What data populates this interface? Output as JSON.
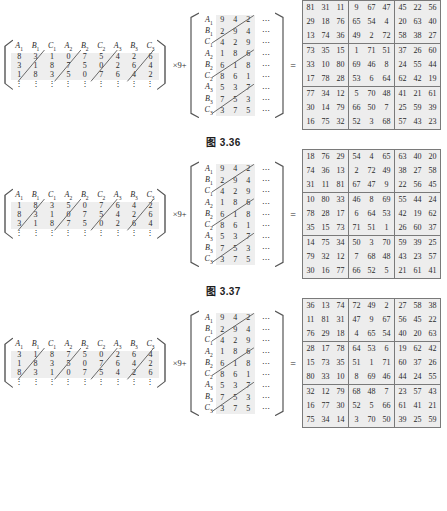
{
  "document": {
    "title": "Latin square matrix construction figures",
    "operator_multiply": "×9+",
    "operator_equals": "="
  },
  "figures": [
    {
      "id": "fig-3-36",
      "caption": "图 3.36",
      "left_matrix": {
        "headers": [
          "A1",
          "B1",
          "C1",
          "A2",
          "B2",
          "C2",
          "A3",
          "B3",
          "C3"
        ],
        "header_display": [
          {
            "base": "A",
            "sub": "1"
          },
          {
            "base": "B",
            "sub": "1"
          },
          {
            "base": "C",
            "sub": "1"
          },
          {
            "base": "A",
            "sub": "2"
          },
          {
            "base": "B",
            "sub": "2"
          },
          {
            "base": "C",
            "sub": "2"
          },
          {
            "base": "A",
            "sub": "3"
          },
          {
            "base": "B",
            "sub": "3"
          },
          {
            "base": "C",
            "sub": "3"
          }
        ],
        "rows": [
          [
            8,
            3,
            1,
            0,
            7,
            5,
            4,
            2,
            6
          ],
          [
            3,
            1,
            8,
            7,
            5,
            0,
            2,
            6,
            4
          ],
          [
            1,
            8,
            3,
            5,
            0,
            7,
            6,
            4,
            2
          ]
        ],
        "continuation": "⋮"
      },
      "mid_matrix": {
        "row_labels": [
          {
            "base": "A",
            "sub": "1"
          },
          {
            "base": "B",
            "sub": "1"
          },
          {
            "base": "C",
            "sub": "1"
          },
          {
            "base": "A",
            "sub": "2"
          },
          {
            "base": "B",
            "sub": "2"
          },
          {
            "base": "C",
            "sub": "2"
          },
          {
            "base": "A",
            "sub": "3"
          },
          {
            "base": "B",
            "sub": "3"
          },
          {
            "base": "C",
            "sub": "3"
          }
        ],
        "rows": [
          [
            9,
            4,
            2
          ],
          [
            2,
            9,
            4
          ],
          [
            4,
            2,
            9
          ],
          [
            1,
            8,
            6
          ],
          [
            6,
            1,
            8
          ],
          [
            8,
            6,
            1
          ],
          [
            5,
            3,
            7
          ],
          [
            7,
            5,
            3
          ],
          [
            3,
            7,
            5
          ]
        ],
        "ellipsis": "⋯"
      },
      "result_matrix": {
        "rows": [
          [
            81,
            31,
            11,
            9,
            67,
            47,
            45,
            22,
            56
          ],
          [
            29,
            18,
            76,
            65,
            54,
            4,
            20,
            63,
            40
          ],
          [
            13,
            74,
            36,
            49,
            2,
            72,
            58,
            38,
            27
          ],
          [
            73,
            35,
            15,
            1,
            71,
            51,
            37,
            26,
            60
          ],
          [
            33,
            10,
            80,
            69,
            46,
            8,
            24,
            55,
            44
          ],
          [
            17,
            78,
            28,
            53,
            6,
            64,
            62,
            42,
            19
          ],
          [
            77,
            34,
            12,
            5,
            70,
            48,
            41,
            21,
            61
          ],
          [
            30,
            14,
            79,
            66,
            50,
            7,
            25,
            59,
            39
          ],
          [
            16,
            75,
            32,
            52,
            3,
            68,
            57,
            43,
            23
          ]
        ]
      }
    },
    {
      "id": "fig-3-37",
      "caption": "图 3.37",
      "left_matrix": {
        "headers": [
          "A1",
          "B1",
          "C1",
          "A2",
          "B2",
          "C2",
          "A3",
          "B3",
          "C3"
        ],
        "header_display": [
          {
            "base": "A",
            "sub": "1"
          },
          {
            "base": "B",
            "sub": "1"
          },
          {
            "base": "C",
            "sub": "1"
          },
          {
            "base": "A",
            "sub": "2"
          },
          {
            "base": "B",
            "sub": "2"
          },
          {
            "base": "C",
            "sub": "2"
          },
          {
            "base": "A",
            "sub": "3"
          },
          {
            "base": "B",
            "sub": "3"
          },
          {
            "base": "C",
            "sub": "3"
          }
        ],
        "rows": [
          [
            1,
            8,
            3,
            5,
            0,
            7,
            6,
            4,
            2
          ],
          [
            8,
            3,
            1,
            0,
            7,
            5,
            4,
            2,
            6
          ],
          [
            3,
            1,
            8,
            7,
            5,
            0,
            2,
            6,
            4
          ]
        ],
        "continuation": "⋮"
      },
      "mid_matrix": {
        "row_labels": [
          {
            "base": "A",
            "sub": "1"
          },
          {
            "base": "B",
            "sub": "1"
          },
          {
            "base": "C",
            "sub": "1"
          },
          {
            "base": "A",
            "sub": "2"
          },
          {
            "base": "B",
            "sub": "2"
          },
          {
            "base": "C",
            "sub": "2"
          },
          {
            "base": "A",
            "sub": "3"
          },
          {
            "base": "B",
            "sub": "3"
          },
          {
            "base": "C",
            "sub": "3"
          }
        ],
        "rows": [
          [
            9,
            4,
            2
          ],
          [
            2,
            9,
            4
          ],
          [
            4,
            2,
            9
          ],
          [
            1,
            8,
            6
          ],
          [
            6,
            1,
            8
          ],
          [
            8,
            6,
            1
          ],
          [
            5,
            3,
            7
          ],
          [
            7,
            5,
            3
          ],
          [
            3,
            7,
            5
          ]
        ],
        "ellipsis": "⋯"
      },
      "result_matrix": {
        "rows": [
          [
            18,
            76,
            29,
            54,
            4,
            65,
            63,
            40,
            20
          ],
          [
            74,
            36,
            13,
            2,
            72,
            49,
            38,
            27,
            58
          ],
          [
            31,
            11,
            81,
            67,
            47,
            9,
            22,
            56,
            45
          ],
          [
            10,
            80,
            33,
            46,
            8,
            69,
            55,
            44,
            24
          ],
          [
            78,
            28,
            17,
            6,
            64,
            53,
            42,
            19,
            62
          ],
          [
            35,
            15,
            73,
            71,
            51,
            1,
            26,
            60,
            37
          ],
          [
            14,
            75,
            34,
            50,
            3,
            70,
            59,
            39,
            25
          ],
          [
            79,
            32,
            12,
            7,
            68,
            48,
            43,
            23,
            57
          ],
          [
            30,
            16,
            77,
            66,
            52,
            5,
            21,
            61,
            41
          ]
        ]
      }
    },
    {
      "id": "fig-3-38",
      "caption": "",
      "left_matrix": {
        "headers": [
          "A1",
          "B1",
          "C1",
          "A2",
          "B2",
          "C2",
          "A3",
          "B3",
          "C3"
        ],
        "header_display": [
          {
            "base": "A",
            "sub": "1"
          },
          {
            "base": "B",
            "sub": "1"
          },
          {
            "base": "C",
            "sub": "1"
          },
          {
            "base": "A",
            "sub": "2"
          },
          {
            "base": "B",
            "sub": "2"
          },
          {
            "base": "C",
            "sub": "2"
          },
          {
            "base": "A",
            "sub": "3"
          },
          {
            "base": "B",
            "sub": "3"
          },
          {
            "base": "C",
            "sub": "3"
          }
        ],
        "rows": [
          [
            3,
            1,
            8,
            7,
            5,
            0,
            2,
            6,
            4
          ],
          [
            1,
            8,
            3,
            5,
            0,
            7,
            6,
            4,
            2
          ],
          [
            8,
            3,
            1,
            0,
            7,
            5,
            4,
            2,
            6
          ]
        ],
        "continuation": "⋮"
      },
      "mid_matrix": {
        "row_labels": [
          {
            "base": "A",
            "sub": "1"
          },
          {
            "base": "B",
            "sub": "1"
          },
          {
            "base": "C",
            "sub": "1"
          },
          {
            "base": "A",
            "sub": "2"
          },
          {
            "base": "B",
            "sub": "2"
          },
          {
            "base": "C",
            "sub": "2"
          },
          {
            "base": "A",
            "sub": "3"
          },
          {
            "base": "B",
            "sub": "3"
          },
          {
            "base": "C",
            "sub": "3"
          }
        ],
        "rows": [
          [
            9,
            4,
            2
          ],
          [
            2,
            9,
            4
          ],
          [
            4,
            2,
            9
          ],
          [
            1,
            8,
            6
          ],
          [
            6,
            1,
            8
          ],
          [
            8,
            6,
            1
          ],
          [
            5,
            3,
            7
          ],
          [
            7,
            5,
            3
          ],
          [
            3,
            7,
            5
          ]
        ],
        "ellipsis": "⋯"
      },
      "result_matrix": {
        "rows": [
          [
            36,
            13,
            74,
            72,
            49,
            2,
            27,
            58,
            38
          ],
          [
            11,
            81,
            31,
            47,
            9,
            67,
            56,
            45,
            22
          ],
          [
            76,
            29,
            18,
            4,
            65,
            54,
            40,
            20,
            63
          ],
          [
            28,
            17,
            78,
            64,
            53,
            6,
            19,
            62,
            42
          ],
          [
            15,
            73,
            35,
            51,
            1,
            71,
            60,
            37,
            26
          ],
          [
            80,
            33,
            10,
            8,
            69,
            46,
            44,
            24,
            55
          ],
          [
            32,
            12,
            79,
            68,
            48,
            7,
            23,
            57,
            43
          ],
          [
            16,
            77,
            30,
            52,
            5,
            66,
            61,
            41,
            21
          ],
          [
            75,
            34,
            14,
            3,
            70,
            50,
            39,
            25,
            59
          ]
        ]
      }
    }
  ]
}
